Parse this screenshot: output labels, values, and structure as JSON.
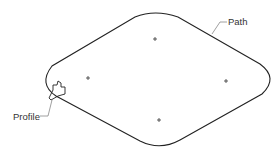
{
  "diagram": {
    "labels": {
      "path": "Path",
      "profile": "Profile"
    },
    "colors": {
      "stroke": "#222222",
      "leader": "#777777",
      "text": "#333333"
    },
    "markers": [
      {
        "x": 155,
        "y": 39
      },
      {
        "x": 88,
        "y": 78
      },
      {
        "x": 226,
        "y": 81
      },
      {
        "x": 159,
        "y": 120
      }
    ]
  }
}
